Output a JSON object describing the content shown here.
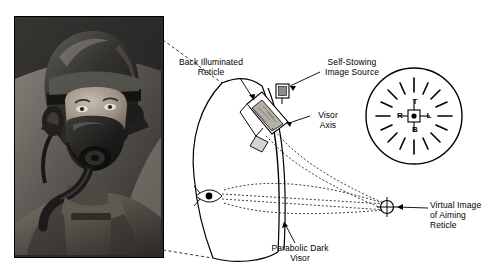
{
  "figure": {
    "labels": [
      {
        "id": "back-illuminated-reticle",
        "text": "Back Illuminated\nReticle",
        "x": 168,
        "y": 57,
        "w": 86
      },
      {
        "id": "self-stowing-image-source",
        "text": "Self-Stowing\nImage Source",
        "x": 312,
        "y": 57,
        "w": 80
      },
      {
        "id": "visor-axis",
        "text": "Visor\nAxis",
        "x": 312,
        "y": 110,
        "w": 32
      },
      {
        "id": "parabolic-dark-visor",
        "text": "Parabolic Dark\nVisor",
        "x": 258,
        "y": 243,
        "w": 84
      },
      {
        "id": "virtual-image-of-aiming-reticle",
        "text": "Virtual Image\nof Aiming\nReticle",
        "x": 430,
        "y": 205,
        "w": 62
      }
    ],
    "reticle_letters": {
      "top": "T",
      "left": "R",
      "right": "L",
      "bottom": "B"
    },
    "colors": {
      "line": "#000000",
      "background": "#ffffff",
      "photo_dark": "#1c1c1c",
      "photo_mid": "#6b6b6b",
      "photo_light": "#b9b4ac"
    }
  }
}
